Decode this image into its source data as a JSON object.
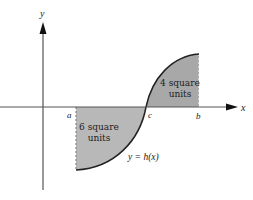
{
  "diagram": {
    "axes": {
      "x_label": "x",
      "y_label": "y"
    },
    "points": {
      "a": "a",
      "c": "c",
      "b": "b"
    },
    "regions": [
      {
        "id": "left",
        "line1": "6 square",
        "line2": "units",
        "sign": "below x-axis"
      },
      {
        "id": "right",
        "line1": "4 square",
        "line2": "units",
        "sign": "above x-axis"
      }
    ],
    "curve_label": "y = h(x)",
    "colors": {
      "fill": "#b3b3b3",
      "curve": "#222222",
      "axis": "#555555"
    }
  }
}
